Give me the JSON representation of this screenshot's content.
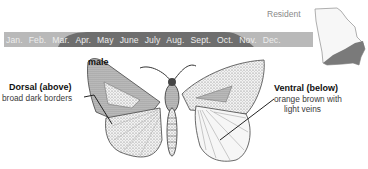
{
  "header": {
    "status_label": "Resident"
  },
  "flight_calendar": {
    "months": [
      "Jan.",
      "Feb.",
      "Mar.",
      "Apr.",
      "May",
      "June",
      "July",
      "Aug.",
      "Sept.",
      "Oct.",
      "Nov.",
      "Dec."
    ],
    "active_from": "Mar.",
    "active_to": "Sept.",
    "colors": {
      "bar_background": "#b9b9b9",
      "active_band": "#6e6e6e",
      "text": "#ededed"
    }
  },
  "range_map": {
    "region": "state-outline",
    "highlight_color": "#7a7a7a",
    "outline_color": "#9a9a9a"
  },
  "illustration": {
    "sex_label": "male",
    "dorsal": {
      "title": "Dorsal (above)",
      "description": "broad dark borders"
    },
    "ventral": {
      "title": "Ventral (below)",
      "description_line1": "orange brown with",
      "description_line2": "light veins"
    }
  }
}
